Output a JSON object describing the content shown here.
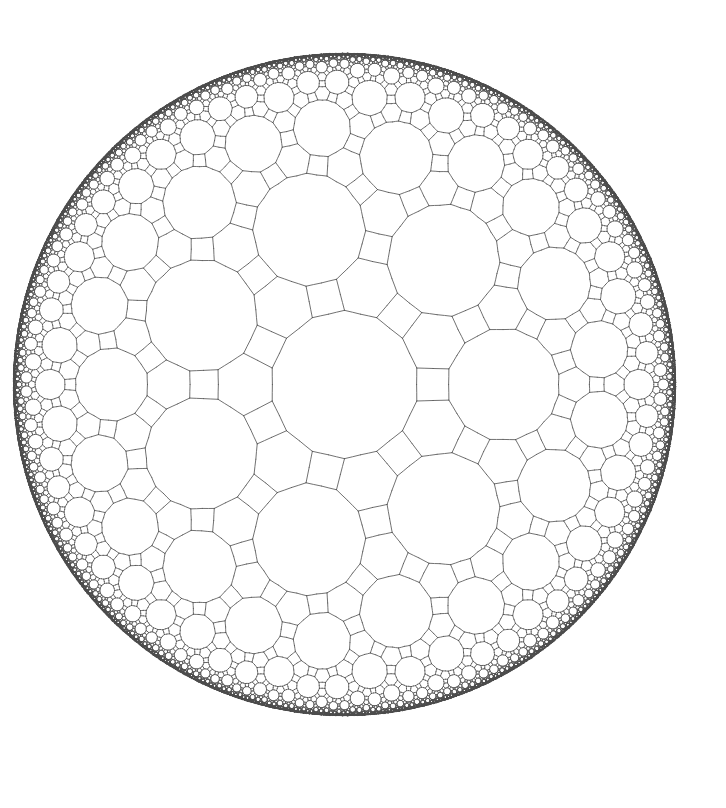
{
  "figure": {
    "kind": "hyperbolic-tiling",
    "model": "Poincare disk",
    "tiling_name": "rhombitriheptagonal tiling",
    "vertex_configuration": "3.4.7.4",
    "schwarz_triangle": [
      2,
      3,
      7
    ],
    "center_tile": "heptagon",
    "center_tile_orientation_deg": -90,
    "disk": {
      "cx": 344.5,
      "cy": 384.5,
      "r": 332
    },
    "canvas": {
      "width": 726,
      "height": 808,
      "background": "#ffffff"
    },
    "stroke": {
      "color": "#4d4d4d",
      "width": 0.8
    },
    "render_limits": {
      "max_radius": 0.9985,
      "min_pixel_size": 0.6,
      "max_triangles": 90000
    }
  }
}
